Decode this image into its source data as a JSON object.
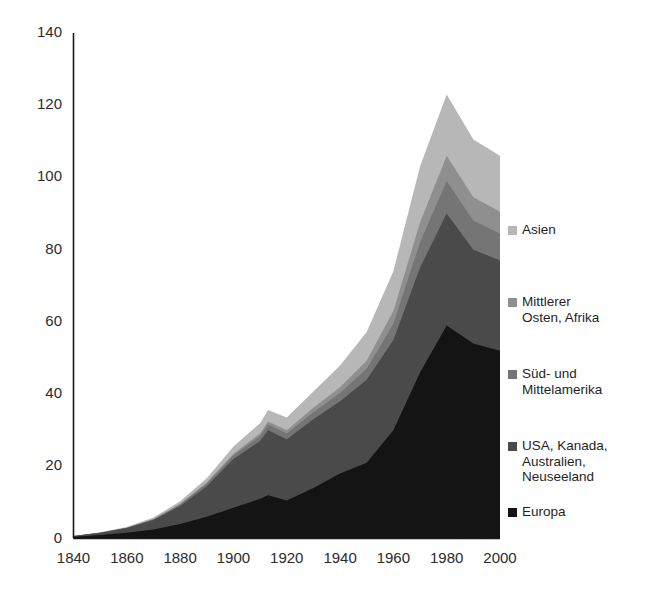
{
  "chart_data": {
    "type": "area",
    "stacked": true,
    "title": "",
    "subtitle": "",
    "xlabel": "",
    "ylabel": "",
    "xlim": [
      1840,
      2000
    ],
    "ylim": [
      0,
      140
    ],
    "grid": false,
    "legend_position": "right",
    "x": [
      1840,
      1850,
      1860,
      1870,
      1880,
      1890,
      1900,
      1910,
      1913,
      1920,
      1930,
      1940,
      1950,
      1960,
      1970,
      1980,
      1990,
      2000
    ],
    "xticks": [
      "1840",
      "1860",
      "1880",
      "1900",
      "1920",
      "1940",
      "1960",
      "1980",
      "2000"
    ],
    "xtick_values": [
      1840,
      1860,
      1880,
      1900,
      1920,
      1940,
      1960,
      1980,
      2000
    ],
    "yticks": [
      "0",
      "20",
      "40",
      "60",
      "80",
      "100",
      "120",
      "140"
    ],
    "ytick_values": [
      0,
      20,
      40,
      60,
      80,
      100,
      120,
      140
    ],
    "series": [
      {
        "name": "Europa",
        "color": "#141414",
        "values": [
          0.5,
          1.0,
          1.6,
          2.5,
          4.0,
          6.0,
          8.5,
          11.0,
          12.0,
          10.5,
          14.0,
          18.0,
          21.0,
          30.0,
          46.0,
          59.0,
          54.0,
          52.0
        ]
      },
      {
        "name": "USA, Kanada, Australien, Neuseeland",
        "color": "#4a4a4a",
        "values": [
          0.2,
          0.6,
          1.3,
          2.6,
          5.0,
          8.5,
          13.5,
          16.0,
          18.0,
          17.0,
          19.0,
          20.0,
          23.0,
          25.0,
          29.0,
          31.0,
          26.0,
          25.0
        ]
      },
      {
        "name": "Süd- und Mittelamerika",
        "color": "#757575",
        "values": [
          0.0,
          0.0,
          0.1,
          0.2,
          0.4,
          0.7,
          1.0,
          1.4,
          1.6,
          1.6,
          2.0,
          2.3,
          3.0,
          4.5,
          7.0,
          9.0,
          8.0,
          7.5
        ]
      },
      {
        "name": "Mittlerer Osten, Afrika",
        "color": "#8f8f8f",
        "values": [
          0.0,
          0.0,
          0.0,
          0.1,
          0.2,
          0.3,
          0.5,
          0.7,
          0.8,
          0.9,
          1.2,
          1.6,
          2.2,
          3.5,
          5.5,
          7.0,
          6.5,
          6.0
        ]
      },
      {
        "name": "Asien",
        "color": "#b7b7b7",
        "values": [
          0.0,
          0.1,
          0.2,
          0.4,
          0.7,
          1.2,
          2.0,
          2.8,
          3.2,
          3.5,
          4.5,
          6.0,
          8.0,
          11.0,
          15.5,
          17.0,
          16.0,
          15.5
        ]
      }
    ],
    "totals": [
      0.7,
      1.7,
      3.2,
      5.8,
      10.3,
      16.7,
      25.5,
      31.9,
      35.6,
      33.5,
      40.7,
      47.9,
      57.2,
      74.0,
      103.0,
      123.0,
      110.5,
      106.0
    ]
  },
  "legend": {
    "items": [
      {
        "label": "Asien",
        "color": "#b7b7b7",
        "top": 0
      },
      {
        "label": "Mittlerer\nOsten, Afrika",
        "color": "#8f8f8f",
        "top": 72
      },
      {
        "label": "Süd- und\nMittelamerika",
        "color": "#757575",
        "top": 144
      },
      {
        "label": "USA, Kanada,\nAustralien,\nNeuseeland",
        "color": "#4a4a4a",
        "top": 216
      },
      {
        "label": "Europa",
        "color": "#141414",
        "top": 282
      }
    ]
  },
  "axes": {
    "axis_color": "#1a1a1a"
  }
}
